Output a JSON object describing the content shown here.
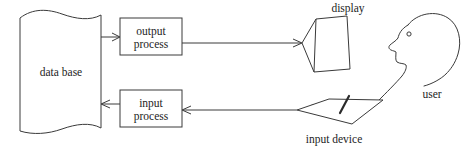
{
  "diagram": {
    "background_color": "#ffffff",
    "stroke_color": "#3a3a3a",
    "text_color": "#1d1d1d",
    "nodes": [
      {
        "id": "data-base",
        "label": "data base",
        "shape": "torn-paper-scroll",
        "icon": "database-scroll-icon"
      },
      {
        "id": "output-process",
        "label_line1": "output",
        "label_line2": "process",
        "label": "output process",
        "shape": "rectangle",
        "icon": "process-box-icon"
      },
      {
        "id": "input-process",
        "label_line1": "input",
        "label_line2": "process",
        "label": "input process",
        "shape": "rectangle",
        "icon": "process-box-icon"
      },
      {
        "id": "display",
        "label": "display",
        "shape": "monitor-polygon",
        "icon": "display-monitor-icon"
      },
      {
        "id": "user",
        "label": "user",
        "shape": "head-profile",
        "icon": "user-head-profile-icon"
      },
      {
        "id": "input-device",
        "label": "input device",
        "shape": "tablet-parallelogram-with-stylus",
        "icon": "tablet-stylus-icon"
      }
    ],
    "edges": [
      {
        "id": "db-to-output",
        "from": "data-base",
        "to": "output-process",
        "direction": "right",
        "arrow": "open-v"
      },
      {
        "id": "output-to-display",
        "from": "output-process",
        "to": "display",
        "direction": "right",
        "arrow": "open-v"
      },
      {
        "id": "device-to-input",
        "from": "input-device",
        "to": "input-process",
        "direction": "left",
        "arrow": "open-v"
      },
      {
        "id": "input-to-db",
        "from": "input-process",
        "to": "data-base",
        "direction": "left",
        "arrow": "open-v"
      }
    ]
  }
}
